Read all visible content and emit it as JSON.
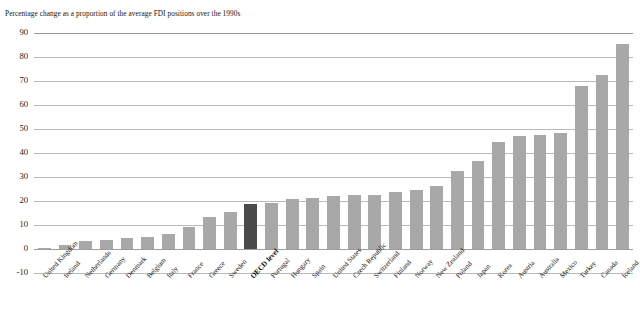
{
  "subtitle": "Percentage change as a proportion of the average FDI positions over the 1990s",
  "colors": {
    "bar": "#a8a8a8",
    "highlight_bar": "#4b4b4b",
    "gridline": "#b9b9b9",
    "text": "#141414",
    "background": "#ffffff"
  },
  "axis": {
    "y_ticks": [
      "90",
      "80",
      "70",
      "60",
      "50",
      "40",
      "30",
      "20",
      "10",
      "0",
      "-10"
    ],
    "y_min": -10,
    "y_max": 90,
    "y_step": 10
  },
  "chart_data": {
    "type": "bar",
    "title": "",
    "subtitle": "Percentage change as a proportion of the average FDI positions over the 1990s",
    "xlabel": "",
    "ylabel": "",
    "ylim": [
      -10,
      90
    ],
    "ytick_step": 10,
    "grid": true,
    "legend": false,
    "highlight_category": "OECD level",
    "categories": [
      "United Kingdom",
      "Ireland",
      "Netherlands",
      "Germany",
      "Denmark",
      "Belgium",
      "Italy",
      "France",
      "Greece",
      "Sweden",
      "OECD level",
      "Portugal",
      "Hungary",
      "Spain",
      "United States",
      "Czech Republic",
      "Switzerland",
      "Finland",
      "Norway",
      "New Zealand",
      "Poland",
      "Japan",
      "Korea",
      "Austria",
      "Australia",
      "Mexico",
      "Turkey",
      "Canada",
      "Iceland"
    ],
    "values": [
      0.2,
      1.8,
      3.5,
      3.8,
      4.4,
      5.1,
      6.3,
      9.2,
      13.2,
      15.3,
      18.8,
      19.2,
      20.8,
      21.1,
      21.9,
      22.3,
      22.4,
      23.8,
      24.7,
      26.2,
      32.3,
      36.6,
      44.6,
      46.9,
      47.4,
      48.3,
      67.9,
      72.6,
      85.5
    ]
  }
}
